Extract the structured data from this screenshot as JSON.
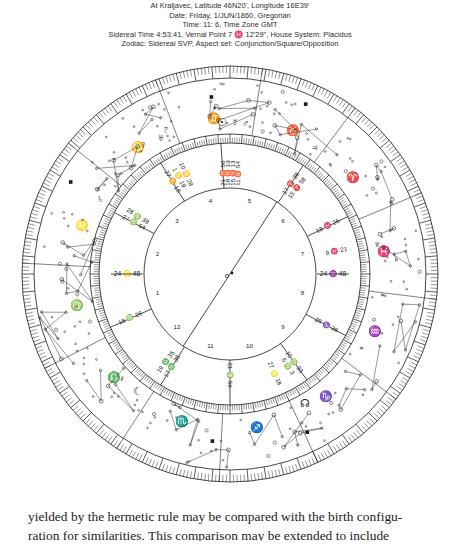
{
  "page": {
    "background": "#ffffff",
    "ink": "#1a1a1a"
  },
  "header": {
    "lines": [
      "At Kraljavec, Latitude 46N20', Longitude 16E39'",
      "Date: Friday, 1/JUN/1860, Gregorian",
      "Time: 11: 6, Time Zone GMT",
      "Sidereal Time   4:53:41, Vernal Point   7 ♓ 12'29\",  House System: Placidus",
      "Zodiac: Sidereal SVP, Aspect set: Conjunction/Square/Opposition"
    ]
  },
  "chart": {
    "center": {
      "x": 216,
      "y": 222
    },
    "radii": {
      "inner_circle": 86,
      "house_ring_inner": 86,
      "degree_ring_inner": 131,
      "degree_ring_outer": 140,
      "constellation_inner": 140,
      "constellation_outer": 196,
      "outer_tick_inner": 196,
      "outer_tick_outer": 208,
      "outer_rim": 210
    },
    "house_numbers": [
      "1",
      "2",
      "3",
      "4",
      "5",
      "6",
      "7",
      "8",
      "9",
      "10",
      "11",
      "12"
    ],
    "zodiac_glyphs": [
      {
        "name": "cancer",
        "glyph": "♋",
        "angle_deg": 126
      },
      {
        "name": "gemini",
        "glyph": "♊",
        "angle_deg": 96
      },
      {
        "name": "taurus",
        "glyph": "♉",
        "angle_deg": 66
      },
      {
        "name": "aries",
        "glyph": "♈",
        "angle_deg": 38
      },
      {
        "name": "pisces",
        "glyph": "♓",
        "angle_deg": 8
      },
      {
        "name": "aquarius",
        "glyph": "♒",
        "angle_deg": -22
      },
      {
        "name": "capricorn",
        "glyph": "♑",
        "angle_deg": -52
      },
      {
        "name": "sagittarius",
        "glyph": "♐",
        "angle_deg": -80
      },
      {
        "name": "scorpio",
        "glyph": "♏",
        "angle_deg": -108
      },
      {
        "name": "libra",
        "glyph": "♎",
        "angle_deg": -138
      },
      {
        "name": "virgo",
        "glyph": "♍",
        "angle_deg": -168
      },
      {
        "name": "leo",
        "glyph": "♌",
        "angle_deg": 162
      }
    ],
    "cusp_labels": [
      {
        "name": "cusp-1-ascendant",
        "text": "24 ♌ 48",
        "angle_deg": 180,
        "orient": "horizontal"
      },
      {
        "name": "cusp-7-descendant",
        "text": "24 ♒ 48",
        "angle_deg": 0,
        "orient": "horizontal"
      },
      {
        "name": "cusp-2",
        "text": "27 ♍ 54",
        "angle_deg": 152,
        "orient": "radial"
      },
      {
        "name": "cusp-2b",
        "text": "28 ♍ 38",
        "angle_deg": 148,
        "orient": "radial"
      },
      {
        "name": "cusp-3",
        "text": "27 ♊ 18",
        "angle_deg": 122,
        "orient": "radial"
      },
      {
        "name": "cusp-3b",
        "text": "1 ♋ 19",
        "angle_deg": 118,
        "orient": "radial"
      },
      {
        "name": "cusp-3c",
        "text": "10 ♋ 28",
        "angle_deg": 114,
        "orient": "radial"
      },
      {
        "name": "cusp-4",
        "text": "21 ♉ 56",
        "angle_deg": 94,
        "orient": "vertical"
      },
      {
        "name": "cusp-4b",
        "text": "18 ♉ 19",
        "angle_deg": 91,
        "orient": "vertical"
      },
      {
        "name": "cusp-4c",
        "text": "15 ♉ 13",
        "angle_deg": 88,
        "orient": "vertical"
      },
      {
        "name": "cusp-4d",
        "text": "11 ♉ 54",
        "angle_deg": 85,
        "orient": "vertical"
      },
      {
        "name": "cusp-5",
        "text": "17 ♈ 38",
        "angle_deg": 56,
        "orient": "radial"
      },
      {
        "name": "cusp-5b",
        "text": "15 ♈ 58",
        "angle_deg": 52,
        "orient": "radial"
      },
      {
        "name": "cusp-6",
        "text": "18 ♓ 26",
        "angle_deg": 26,
        "orient": "radial"
      },
      {
        "name": "cusp-6b",
        "text": "6 ♓ 21",
        "angle_deg": 12,
        "orient": "radial"
      },
      {
        "name": "cusp-8",
        "text": "28 ♑ 38",
        "angle_deg": -28,
        "orient": "radial"
      },
      {
        "name": "cusp-9",
        "text": "10 ♍ 33",
        "angle_deg": -54,
        "orient": "radial"
      },
      {
        "name": "cusp-9b",
        "text": "6 ♍ 3",
        "angle_deg": -58,
        "orient": "radial"
      },
      {
        "name": "cusp-9c",
        "text": "27 ♌ 18",
        "angle_deg": -66,
        "orient": "radial"
      },
      {
        "name": "cusp-10",
        "text": "21 ♍ 56",
        "angle_deg": -90,
        "orient": "vertical"
      },
      {
        "name": "cusp-11",
        "text": "17 ♎ 38",
        "angle_deg": -122,
        "orient": "radial"
      },
      {
        "name": "cusp-11b",
        "text": "19 ♎ 35",
        "angle_deg": -126,
        "orient": "radial"
      },
      {
        "name": "cusp-12",
        "text": "18 ♍ 26",
        "angle_deg": -156,
        "orient": "radial"
      }
    ],
    "planets": [
      {
        "name": "sun",
        "glyph": "☉",
        "angle_deg": 93,
        "r": 151
      },
      {
        "name": "mercury",
        "glyph": "☿",
        "angle_deg": 88,
        "r": 151
      },
      {
        "name": "mars",
        "glyph": "♂",
        "angle_deg": 84,
        "r": 151
      },
      {
        "name": "venus",
        "glyph": "♀",
        "angle_deg": 124,
        "r": 155
      },
      {
        "name": "uranus",
        "glyph": "♅",
        "angle_deg": 117,
        "r": 152
      },
      {
        "name": "pluto",
        "glyph": "♇",
        "angle_deg": 114,
        "r": 157
      },
      {
        "name": "saturn",
        "glyph": "♄",
        "angle_deg": 150,
        "r": 150
      },
      {
        "name": "jupiter",
        "glyph": "♃",
        "angle_deg": 56,
        "r": 152
      },
      {
        "name": "neptune",
        "glyph": "♆",
        "angle_deg": 11,
        "r": 150
      },
      {
        "name": "moon",
        "glyph": "☾",
        "angle_deg": -128,
        "r": 150
      },
      {
        "name": "node",
        "glyph": "☊",
        "angle_deg": -60,
        "r": 150
      }
    ],
    "aspect_line": {
      "name": "opposition-axis",
      "from_deg": 57,
      "to_deg": -123
    }
  },
  "footer": {
    "line1": "yielded by the hermetic rule may be compared with the birth configu-",
    "line2": "ration for similarities. This comparison may be extended to include"
  }
}
